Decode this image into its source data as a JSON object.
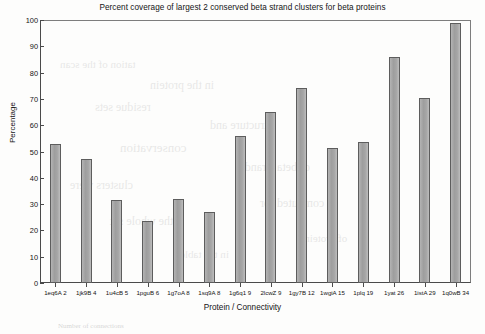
{
  "chart_data": {
    "type": "bar",
    "title": "Percent coverage of largest 2 conserved beta strand clusters for beta proteins",
    "xlabel": "Protein / Connectivity",
    "ylabel": "Percentage",
    "ylim": [
      0,
      100
    ],
    "yticks": [
      0,
      10,
      20,
      30,
      40,
      50,
      60,
      70,
      80,
      90,
      100
    ],
    "grid": false,
    "legend": null,
    "categories": [
      "1eq6A 2",
      "1jk9B 4",
      "1u4cB 5",
      "1pguB 6",
      "1g7oA 8",
      "1sq9A 8",
      "1g6q1 9",
      "2lcwZ 9",
      "1gy7B 12",
      "1wgiA 15",
      "1plq 19",
      "1yat 26",
      "1istA 29",
      "1q0wB 34"
    ],
    "values": [
      53,
      47,
      31.5,
      23.5,
      32,
      27,
      56,
      65,
      74,
      51.5,
      53.5,
      86,
      70.5,
      99
    ],
    "bar_color": "#a8a8a8",
    "bar_edge_color": "#5d5d5d"
  },
  "figure": {
    "bottom_note": "Number of connections"
  }
}
